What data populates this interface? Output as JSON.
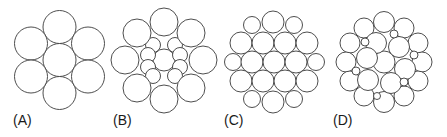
{
  "figure": {
    "stroke_color": "#3a3a3a",
    "fill_color": "#ffffff",
    "panels": [
      {
        "label": "(A)",
        "label_x": 13,
        "circles": [
          [
            59.5,
            60,
            16.5
          ],
          [
            59.5,
            27,
            16.5
          ],
          [
            59.5,
            93,
            16.5
          ],
          [
            31,
            43.5,
            16.5
          ],
          [
            88,
            43.5,
            16.5
          ],
          [
            31,
            76.5,
            16.5
          ],
          [
            88,
            76.5,
            16.5
          ]
        ]
      },
      {
        "label": "(B)",
        "label_x": 113,
        "circles": [
          [
            164,
            60,
            11
          ],
          [
            153,
            45,
            7.5
          ],
          [
            175,
            45,
            7.5
          ],
          [
            179,
            50,
            0
          ],
          [
            148,
            55,
            7.5
          ],
          [
            180,
            55,
            7.5
          ],
          [
            148,
            67,
            7.5
          ],
          [
            180,
            67,
            7.5
          ],
          [
            153,
            76,
            7.5
          ],
          [
            175,
            76,
            7.5
          ],
          [
            164,
            22,
            14
          ],
          [
            137,
            33,
            14
          ],
          [
            191,
            33,
            14
          ],
          [
            125,
            60,
            14
          ],
          [
            203,
            60,
            14
          ],
          [
            137,
            88,
            14
          ],
          [
            191,
            88,
            14
          ],
          [
            164,
            99,
            14
          ]
        ]
      },
      {
        "label": "(C)",
        "label_x": 224,
        "circles": [
          [
            252,
            25,
            8.5
          ],
          [
            273,
            22,
            11
          ],
          [
            294,
            25,
            8.5
          ],
          [
            241,
            43,
            11
          ],
          [
            263,
            43,
            11
          ],
          [
            285,
            43,
            11
          ],
          [
            307,
            43,
            11
          ],
          [
            233,
            62,
            8.5
          ],
          [
            252,
            62,
            11
          ],
          [
            274,
            62,
            11
          ],
          [
            296,
            62,
            11
          ],
          [
            316,
            62,
            8.5
          ],
          [
            241,
            81,
            11
          ],
          [
            263,
            81,
            11
          ],
          [
            285,
            81,
            11
          ],
          [
            307,
            81,
            11
          ],
          [
            252,
            99,
            8.5
          ],
          [
            273,
            102,
            11
          ],
          [
            294,
            99,
            8.5
          ]
        ]
      },
      {
        "label": "(D)",
        "label_x": 333,
        "circles": [
          [
            384,
            62,
            11
          ],
          [
            384,
            22,
            10.5
          ],
          [
            364,
            28,
            10
          ],
          [
            404,
            28,
            10
          ],
          [
            350,
            43,
            10
          ],
          [
            418,
            43,
            10
          ],
          [
            346,
            62,
            10
          ],
          [
            422,
            62,
            10
          ],
          [
            350,
            81,
            10
          ],
          [
            418,
            81,
            10
          ],
          [
            364,
            96,
            10
          ],
          [
            404,
            96,
            10
          ],
          [
            384,
            102,
            10.5
          ],
          [
            376,
            43,
            10.5
          ],
          [
            399,
            47,
            10.5
          ],
          [
            367,
            58,
            10.5
          ],
          [
            405,
            69,
            10.5
          ],
          [
            368,
            80,
            10.5
          ],
          [
            391,
            83,
            10.5
          ],
          [
            365,
            42,
            4
          ],
          [
            394,
            34,
            4
          ],
          [
            414,
            55,
            4
          ],
          [
            356,
            71,
            4
          ],
          [
            377,
            96,
            3.5
          ],
          [
            404,
            82,
            4
          ]
        ]
      }
    ]
  }
}
